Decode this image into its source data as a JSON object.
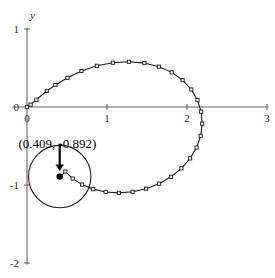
{
  "chart_data": {
    "type": "line",
    "title": "",
    "subtitle": "",
    "xlabel": "x",
    "ylabel": "y",
    "xlim": [
      -0.2,
      3.1
    ],
    "ylim": [
      -2.05,
      1.05
    ],
    "grid": false,
    "legend": null,
    "x_ticks": [
      {
        "value": 0,
        "label": "0"
      },
      {
        "value": 1,
        "label": "1"
      },
      {
        "value": 2,
        "label": "2"
      },
      {
        "value": 3,
        "label": "3"
      }
    ],
    "y_ticks": [
      {
        "value": 1,
        "label": "1"
      },
      {
        "value": 0,
        "label": "0"
      },
      {
        "value": -1,
        "label": "-1"
      },
      {
        "value": -2,
        "label": "-2"
      }
    ],
    "series": [
      {
        "name": "curve",
        "marker": "open-square",
        "x": [
          0.0,
          0.045,
          0.118,
          0.247,
          0.355,
          0.506,
          0.681,
          0.873,
          1.073,
          1.274,
          1.468,
          1.648,
          1.809,
          1.945,
          2.053,
          2.131,
          2.177,
          2.19,
          2.171,
          2.12,
          2.039,
          1.931,
          1.8,
          1.651,
          1.489,
          1.32,
          1.149,
          0.983,
          0.828,
          0.689,
          0.571,
          0.479,
          0.416
        ],
        "y": [
          0.0,
          0.03,
          0.093,
          0.206,
          0.282,
          0.374,
          0.462,
          0.528,
          0.568,
          0.58,
          0.563,
          0.517,
          0.444,
          0.345,
          0.225,
          0.088,
          -0.06,
          -0.214,
          -0.369,
          -0.519,
          -0.659,
          -0.786,
          -0.895,
          -0.983,
          -1.047,
          -1.087,
          -1.101,
          -1.089,
          -1.053,
          -0.995,
          -0.918,
          -0.827,
          -0.892
        ]
      }
    ],
    "annotations": [
      {
        "name": "point-label",
        "text": "(0.409, -0.892)",
        "point_x": 0.409,
        "point_y": -0.892,
        "arrow": "down"
      }
    ],
    "shapes": [
      {
        "name": "generating-circle",
        "type": "circle",
        "center_x": 0.409,
        "center_y": -0.892,
        "radius": 0.39
      },
      {
        "name": "traced-point",
        "type": "filled-dot",
        "center_x": 0.409,
        "center_y": -0.892
      }
    ]
  },
  "axes": {
    "x_name": "x",
    "y_name": "y"
  },
  "colors": {
    "axis": "#666666",
    "curve": "#1a1a1a",
    "marker_fill": "#ffffff",
    "annotation": "#000000",
    "background": "#ffffff"
  }
}
